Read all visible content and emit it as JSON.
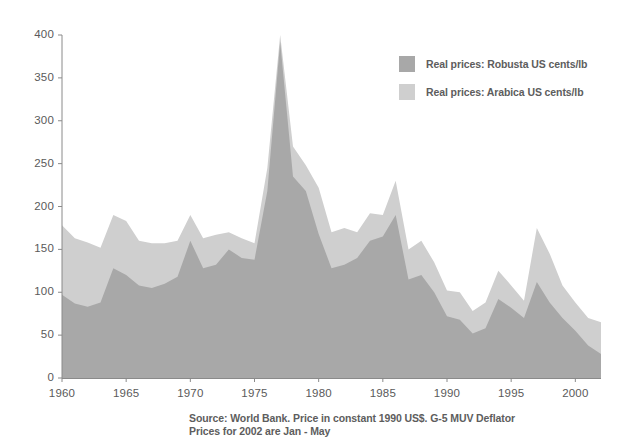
{
  "chart_data": {
    "type": "area",
    "title": "",
    "subtitle": "",
    "xlabel": "",
    "ylabel": "",
    "xlim": [
      1960,
      2002
    ],
    "ylim": [
      0,
      400
    ],
    "ytick_labels": [
      "400",
      "350",
      "300",
      "250",
      "200",
      "150",
      "100",
      "50",
      "0"
    ],
    "ytick_values": [
      400,
      350,
      300,
      250,
      200,
      150,
      100,
      50,
      0
    ],
    "xtick_labels": [
      "1960",
      "1965",
      "1970",
      "1975",
      "1980",
      "1985",
      "1990",
      "1995",
      "2000"
    ],
    "xtick_values": [
      1960,
      1965,
      1970,
      1975,
      1980,
      1985,
      1990,
      1995,
      2000
    ],
    "grid": false,
    "legend_position": "upper-right",
    "x": [
      1960,
      1961,
      1962,
      1963,
      1964,
      1965,
      1966,
      1967,
      1968,
      1969,
      1970,
      1971,
      1972,
      1973,
      1974,
      1975,
      1976,
      1977,
      1978,
      1979,
      1980,
      1981,
      1982,
      1983,
      1984,
      1985,
      1986,
      1987,
      1988,
      1989,
      1990,
      1991,
      1992,
      1993,
      1994,
      1995,
      1996,
      1997,
      1998,
      1999,
      2000,
      2001,
      2002
    ],
    "series": [
      {
        "name": "Real prices: Arabica US cents/lb",
        "color": "#cfcfcf",
        "values": [
          178,
          163,
          158,
          152,
          190,
          183,
          160,
          157,
          157,
          160,
          190,
          163,
          167,
          170,
          163,
          157,
          245,
          400,
          270,
          248,
          222,
          170,
          175,
          170,
          192,
          190,
          230,
          150,
          160,
          135,
          102,
          100,
          78,
          88,
          125,
          108,
          90,
          175,
          145,
          108,
          88,
          70,
          65
        ]
      },
      {
        "name": "Real prices: Robusta US cents/lb",
        "color": "#a8a8a8",
        "values": [
          97,
          87,
          83,
          88,
          128,
          120,
          108,
          105,
          110,
          118,
          160,
          128,
          132,
          150,
          140,
          138,
          218,
          392,
          235,
          218,
          168,
          128,
          132,
          140,
          160,
          165,
          190,
          115,
          120,
          100,
          72,
          68,
          52,
          58,
          92,
          82,
          70,
          112,
          88,
          70,
          55,
          38,
          28
        ]
      }
    ]
  },
  "legend": {
    "items": [
      {
        "label": "Real prices: Robusta US cents/lb",
        "color": "#a8a8a8"
      },
      {
        "label": "Real prices: Arabica US cents/lb",
        "color": "#cfcfcf"
      }
    ]
  },
  "footnote": {
    "line1": "Source: World Bank. Price in constant 1990 US$. G-5 MUV Deflator",
    "line2": "Prices for 2002 are Jan - May"
  }
}
